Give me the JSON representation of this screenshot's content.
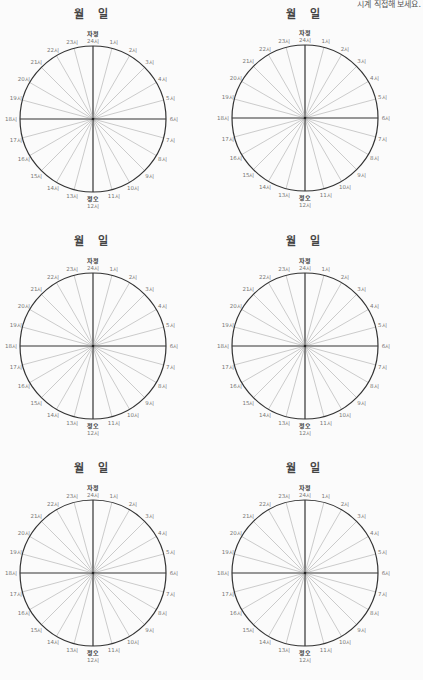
{
  "page": {
    "corner_note": "시계 직접해 보세요."
  },
  "dial_labels": {
    "top_marker": "자정",
    "bottom_marker": "정오",
    "hours": [
      "24시",
      "1시",
      "2시",
      "3시",
      "4시",
      "5시",
      "6시",
      "7시",
      "8시",
      "9시",
      "10시",
      "11시",
      "12시",
      "13시",
      "14시",
      "15시",
      "16시",
      "17시",
      "18시",
      "19시",
      "20시",
      "21시",
      "22시",
      "23시"
    ]
  },
  "dials": [
    {
      "month_label": "월",
      "day_label": "일",
      "cx": 93,
      "cy": 119,
      "left": 0,
      "top": 0
    },
    {
      "month_label": "월",
      "day_label": "일",
      "cx": 93,
      "cy": 118,
      "left": 212,
      "top": 0
    },
    {
      "month_label": "월",
      "day_label": "일",
      "cx": 93,
      "cy": 119,
      "left": 0,
      "top": 227
    },
    {
      "month_label": "월",
      "day_label": "일",
      "cx": 93,
      "cy": 119,
      "left": 212,
      "top": 227
    },
    {
      "month_label": "월",
      "day_label": "일",
      "cx": 93,
      "cy": 119,
      "left": 0,
      "top": 454
    },
    {
      "month_label": "월",
      "day_label": "일",
      "cx": 93,
      "cy": 119,
      "left": 212,
      "top": 454
    }
  ],
  "style": {
    "radius": 73,
    "circle_color": "#333333",
    "spoke_color": "#9a9a9a",
    "axis_color": "#333333"
  }
}
